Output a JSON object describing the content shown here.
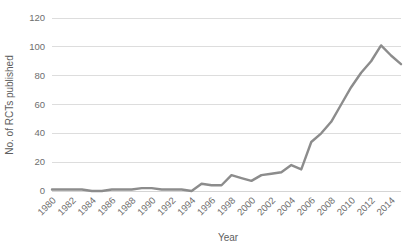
{
  "chart_data": {
    "type": "line",
    "title": "",
    "xlabel": "Year",
    "ylabel": "No. of RCTs published",
    "xlim": [
      1980,
      2015
    ],
    "ylim": [
      0,
      120
    ],
    "grid": true,
    "legend": false,
    "legend_position": "none",
    "line_color": "#8c8c8c",
    "x": [
      1980,
      1981,
      1982,
      1983,
      1984,
      1985,
      1986,
      1987,
      1988,
      1989,
      1990,
      1991,
      1992,
      1993,
      1994,
      1995,
      1996,
      1997,
      1998,
      1999,
      2000,
      2001,
      2002,
      2003,
      2004,
      2005,
      2006,
      2007,
      2008,
      2009,
      2010,
      2011,
      2012,
      2013,
      2014,
      2015
    ],
    "values": [
      1,
      1,
      1,
      1,
      0,
      0,
      1,
      1,
      1,
      2,
      2,
      1,
      1,
      1,
      0,
      5,
      4,
      4,
      11,
      9,
      7,
      11,
      12,
      13,
      18,
      15,
      34,
      40,
      48,
      60,
      72,
      82,
      90,
      101,
      94,
      88
    ],
    "y_ticks": [
      0,
      20,
      40,
      60,
      80,
      100,
      120
    ],
    "y_tick_labels": [
      "0",
      "20",
      "40",
      "60",
      "80",
      "100",
      "120"
    ],
    "x_ticks": [
      1980,
      1982,
      1984,
      1986,
      1988,
      1990,
      1992,
      1994,
      1996,
      1998,
      2000,
      2002,
      2004,
      2006,
      2008,
      2010,
      2012,
      2014
    ],
    "x_tick_labels": [
      "1980",
      "1982",
      "1984",
      "1986",
      "1988",
      "1990",
      "1992",
      "1994",
      "1996",
      "1998",
      "2000",
      "2002",
      "2004",
      "2006",
      "2008",
      "2010",
      "2012",
      "2014"
    ],
    "x_tick_rotation": -45,
    "series": [
      {
        "name": "RCTs published",
        "color": "#8c8c8c",
        "values": [
          1,
          1,
          1,
          1,
          0,
          0,
          1,
          1,
          1,
          2,
          2,
          1,
          1,
          1,
          0,
          5,
          4,
          4,
          11,
          9,
          7,
          11,
          12,
          13,
          18,
          15,
          34,
          40,
          48,
          60,
          72,
          82,
          90,
          101,
          94,
          88
        ]
      }
    ]
  }
}
